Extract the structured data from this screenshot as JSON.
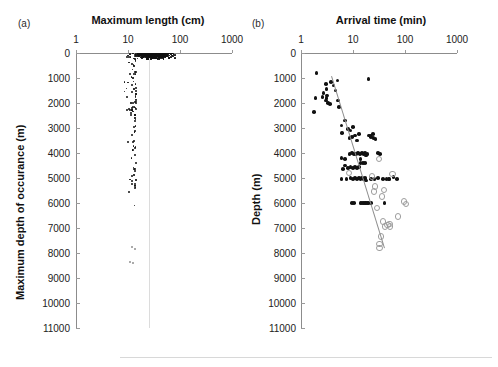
{
  "figure": {
    "width": 498,
    "height": 367,
    "background": "#ffffff",
    "footer_rule": true
  },
  "panels": [
    {
      "tag": "(a)",
      "title": "Maximum length (cm)",
      "ylabel": "Maximum depth of occurance (m)",
      "xticks": [
        "1",
        "10",
        "100",
        "1000"
      ],
      "yticks": [
        "0",
        "1000",
        "2000",
        "3000",
        "4000",
        "5000",
        "6000",
        "7000",
        "8000",
        "9000",
        "10000",
        "11000"
      ]
    },
    {
      "tag": "(b)",
      "title": "Arrival time (min)",
      "ylabel": "Depth (m)",
      "xticks": [
        "1",
        "10",
        "100",
        "1000"
      ],
      "yticks": [
        "0",
        "1000",
        "2000",
        "3000",
        "4000",
        "5000",
        "6000",
        "7000",
        "8000",
        "9000",
        "10000",
        "11000"
      ]
    }
  ],
  "chart_data": [
    {
      "type": "scatter",
      "panel": "(a)",
      "title": "Maximum length (cm)",
      "xlabel": "Maximum length (cm)",
      "ylabel": "Maximum depth of occurance (m)",
      "xscale": "log",
      "xlim": [
        1,
        1000
      ],
      "ylim": [
        0,
        11000
      ],
      "y_inverted": true,
      "grid": false,
      "legend": null,
      "marker": "filled-dot",
      "point_color": "#111111",
      "n_points_approx": 2100,
      "description": "Dense cloud of species points; heavily concentrated between 3 and 300 cm length and 0-2500 m depth, thinning progressively with depth down to about 8500 m with a few isolated deep points.",
      "density_bands": [
        {
          "depth_range": [
            0,
            500
          ],
          "length_range": [
            2,
            400
          ],
          "relative_density": 1.0
        },
        {
          "depth_range": [
            500,
            1500
          ],
          "length_range": [
            2,
            400
          ],
          "relative_density": 0.85
        },
        {
          "depth_range": [
            1500,
            2500
          ],
          "length_range": [
            2,
            300
          ],
          "relative_density": 0.55
        },
        {
          "depth_range": [
            2500,
            3500
          ],
          "length_range": [
            3,
            200
          ],
          "relative_density": 0.3
        },
        {
          "depth_range": [
            3500,
            4500
          ],
          "length_range": [
            3,
            150
          ],
          "relative_density": 0.18
        },
        {
          "depth_range": [
            4500,
            5600
          ],
          "length_range": [
            3,
            120
          ],
          "relative_density": 0.1
        },
        {
          "depth_range": [
            5600,
            6500
          ],
          "length_range": [
            5,
            80
          ],
          "relative_density": 0.03
        },
        {
          "depth_range": [
            6500,
            8700
          ],
          "length_range": [
            8,
            40
          ],
          "relative_density": 0.006
        }
      ]
    },
    {
      "type": "scatter",
      "panel": "(b)",
      "title": "Arrival time (min)",
      "xlabel": "Arrival time (min)",
      "ylabel": "Depth (m)",
      "xscale": "log",
      "xlim": [
        1,
        1000
      ],
      "ylim": [
        0,
        11000
      ],
      "y_inverted": true,
      "grid": false,
      "legend": null,
      "series": [
        {
          "name": "filled",
          "marker": "filled-dot",
          "color": "#111111",
          "points": [
            [
              2.0,
              800
            ],
            [
              1.9,
              1800
            ],
            [
              1.8,
              2350
            ],
            [
              2.6,
              1750
            ],
            [
              2.7,
              1600
            ],
            [
              3.0,
              1250
            ],
            [
              3.1,
              1450
            ],
            [
              3.2,
              1700
            ],
            [
              3.0,
              1900
            ],
            [
              3.1,
              1800
            ],
            [
              3.3,
              2000
            ],
            [
              3.6,
              2050
            ],
            [
              3.8,
              1150
            ],
            [
              4.2,
              1300
            ],
            [
              4.6,
              1500
            ],
            [
              5.0,
              1100
            ],
            [
              5.2,
              1900
            ],
            [
              5.4,
              2150
            ],
            [
              6.0,
              2900
            ],
            [
              6.2,
              3200
            ],
            [
              7.0,
              2700
            ],
            [
              8.0,
              3050
            ],
            [
              8.5,
              3400
            ],
            [
              9.0,
              3100
            ],
            [
              9.5,
              3350
            ],
            [
              10.0,
              2950
            ],
            [
              11.0,
              3300
            ],
            [
              12.0,
              3500
            ],
            [
              13.0,
              3250
            ],
            [
              8.5,
              4050
            ],
            [
              9.5,
              4000
            ],
            [
              10.5,
              4050
            ],
            [
              11.5,
              4050
            ],
            [
              12.5,
              4000
            ],
            [
              13.5,
              4050
            ],
            [
              14.0,
              4250
            ],
            [
              15.0,
              4000
            ],
            [
              16.0,
              4050
            ],
            [
              17.0,
              4000
            ],
            [
              18.0,
              4100
            ],
            [
              19.0,
              4050
            ],
            [
              20.0,
              3300
            ],
            [
              21.0,
              3300
            ],
            [
              22.0,
              3350
            ],
            [
              24.0,
              3250
            ],
            [
              25.0,
              3400
            ],
            [
              27.0,
              3450
            ],
            [
              30.0,
              4000
            ],
            [
              33.0,
              4050
            ],
            [
              20.0,
              1050
            ],
            [
              8.0,
              4600
            ],
            [
              9.0,
              4550
            ],
            [
              10.0,
              4600
            ],
            [
              11.0,
              4550
            ],
            [
              12.0,
              4600
            ],
            [
              13.0,
              4550
            ],
            [
              6.5,
              4650
            ],
            [
              7.0,
              4500
            ],
            [
              6.0,
              5050
            ],
            [
              7.5,
              5050
            ],
            [
              9.0,
              5000
            ],
            [
              10.0,
              5050
            ],
            [
              11.0,
              5000
            ],
            [
              12.0,
              5050
            ],
            [
              13.0,
              5000
            ],
            [
              14.0,
              5050
            ],
            [
              15.0,
              5000
            ],
            [
              16.0,
              5050
            ],
            [
              17.0,
              5000
            ],
            [
              18.0,
              5100
            ],
            [
              22.0,
              5050
            ],
            [
              30.0,
              5000
            ],
            [
              38.0,
              5050
            ],
            [
              44.0,
              5050
            ],
            [
              50.0,
              5050
            ],
            [
              70.0,
              5050
            ],
            [
              60.0,
              4950
            ],
            [
              9.5,
              6000
            ],
            [
              10.5,
              6000
            ],
            [
              14.0,
              6000
            ],
            [
              15.0,
              6000
            ],
            [
              16.0,
              6000
            ],
            [
              17.0,
              6000
            ],
            [
              18.0,
              6000
            ],
            [
              19.0,
              6000
            ],
            [
              20.0,
              6000
            ],
            [
              22.0,
              6000
            ],
            [
              40.0,
              6000
            ],
            [
              48.0,
              5050
            ],
            [
              14.0,
              4400
            ],
            [
              15.5,
              4400
            ],
            [
              17.0,
              4400
            ],
            [
              26.0,
              5050
            ],
            [
              6.0,
              4200
            ],
            [
              7.0,
              4250
            ]
          ]
        },
        {
          "name": "open",
          "marker": "open-circle",
          "color": "#9d9d9d",
          "points": [
            [
              8.0,
              4750
            ],
            [
              30.0,
              4200
            ],
            [
              22.0,
              4900
            ],
            [
              25.0,
              5300
            ],
            [
              24.0,
              5500
            ],
            [
              34.0,
              5700
            ],
            [
              38.0,
              5450
            ],
            [
              55.0,
              4800
            ],
            [
              28.0,
              6150
            ],
            [
              36.0,
              6700
            ],
            [
              40.0,
              6900
            ],
            [
              44.0,
              6850
            ],
            [
              48.0,
              6800
            ],
            [
              50.0,
              6900
            ],
            [
              33.0,
              7300
            ],
            [
              31.0,
              7600
            ],
            [
              31.0,
              7750
            ],
            [
              100.0,
              6000
            ],
            [
              90.0,
              5900
            ],
            [
              70.0,
              6500
            ]
          ]
        }
      ],
      "fit_line": {
        "color": "#8e8e8e",
        "x_start": 4.0,
        "y_start": 900,
        "x_end": 42.0,
        "y_end": 7800
      }
    }
  ]
}
